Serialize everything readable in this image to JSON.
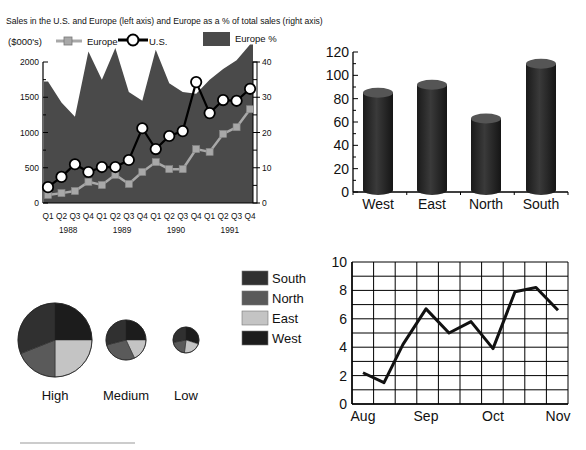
{
  "chart_data": [
    {
      "id": "sales",
      "type": "line",
      "title": "Sales in the U.S. and Europe (left axis) and Europe as a % of total sales (right axis)",
      "ylabel": "($000's)",
      "ylabel_right": "",
      "ylim": [
        0,
        2000
      ],
      "ylim_right": [
        0,
        40
      ],
      "yticks": [
        0,
        500,
        1000,
        1500,
        2000
      ],
      "yticks_right": [
        0,
        10,
        20,
        30,
        40
      ],
      "categories": [
        "Q1",
        "Q2",
        "Q3",
        "Q4",
        "Q1",
        "Q2",
        "Q3",
        "Q4",
        "Q1",
        "Q2",
        "Q3",
        "Q4",
        "Q1",
        "Q2",
        "Q3",
        "Q4"
      ],
      "year_labels": [
        "1988",
        "1989",
        "1990",
        "1991"
      ],
      "legend": [
        {
          "name": "Europe",
          "marker": "square"
        },
        {
          "name": "U.S.",
          "marker": "circle"
        },
        {
          "name": "Europe %",
          "marker": "area"
        }
      ],
      "series": [
        {
          "name": "Europe %",
          "type": "area",
          "axis": "right",
          "color": "#4a4a4a",
          "values": [
            34.5,
            28.5,
            24.5,
            43,
            35,
            44,
            31.5,
            29,
            43.5,
            34,
            31.5,
            31,
            35,
            38,
            40.5,
            45
          ]
        },
        {
          "name": "Europe",
          "type": "line",
          "axis": "left",
          "color": "#a8a8a8",
          "values": [
            115,
            140,
            170,
            300,
            255,
            400,
            270,
            440,
            580,
            480,
            480,
            765,
            725,
            980,
            1075,
            1330
          ]
        },
        {
          "name": "U.S.",
          "type": "line",
          "axis": "left",
          "color": "#000000",
          "values": [
            225,
            370,
            550,
            440,
            510,
            510,
            610,
            1060,
            765,
            950,
            1020,
            1715,
            1275,
            1460,
            1450,
            1620
          ]
        }
      ],
      "grid": false,
      "legend_position": "top"
    },
    {
      "id": "regions",
      "type": "bar",
      "style": "3d-cylinder",
      "categories": [
        "West",
        "East",
        "North",
        "South"
      ],
      "values": [
        85,
        92,
        63,
        110
      ],
      "ylim": [
        0,
        120
      ],
      "yticks": [
        0,
        20,
        40,
        60,
        80,
        100,
        120
      ],
      "title": "",
      "xlabel": "",
      "ylabel": "",
      "color": "#2a2a2a",
      "grid": false
    },
    {
      "id": "pies",
      "type": "pie",
      "legend": [
        {
          "name": "South",
          "color": "#303030"
        },
        {
          "name": "North",
          "color": "#5a5a5a"
        },
        {
          "name": "East",
          "color": "#c4c4c4"
        },
        {
          "name": "West",
          "color": "#1c1c1c"
        }
      ],
      "legend_position": "right",
      "pies": [
        {
          "label": "High",
          "size": "large",
          "slices": {
            "West": 25,
            "East": 25,
            "North": 19,
            "South": 31
          }
        },
        {
          "label": "Medium",
          "size": "medium",
          "slices": {
            "West": 25,
            "East": 18,
            "North": 28,
            "South": 29
          }
        },
        {
          "label": "Low",
          "size": "small",
          "slices": {
            "West": 30,
            "East": 22,
            "North": 20,
            "South": 28
          }
        }
      ]
    },
    {
      "id": "monthly",
      "type": "line",
      "categories": [
        "Aug",
        "Sep",
        "Oct",
        "Nov"
      ],
      "x": [
        0,
        1,
        2,
        3,
        4,
        5,
        6,
        7,
        8,
        9
      ],
      "values": [
        2.2,
        1.5,
        4.2,
        6.7,
        5.0,
        5.8,
        3.9,
        7.9,
        8.2,
        6.6
      ],
      "ylim": [
        0,
        10
      ],
      "yticks": [
        0,
        2,
        4,
        6,
        8,
        10
      ],
      "title": "",
      "xlabel": "",
      "ylabel": "",
      "grid": true,
      "color": "#111111"
    }
  ],
  "labels": {
    "sales_title": "Sales in the U.S. and Europe (left axis) and Europe as a % of total sales (right axis)",
    "sales_units": "($000's)",
    "legend_europe": "Europe",
    "legend_us": "U.S.",
    "legend_europe_pct": "Europe %"
  }
}
